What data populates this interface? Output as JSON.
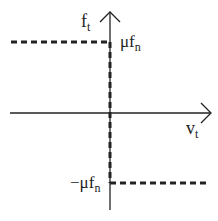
{
  "diagram": {
    "axes": {
      "y_label": "f",
      "y_label_sub": "t",
      "x_label": "v",
      "x_label_sub": "t"
    },
    "levels": {
      "upper_label": "μf",
      "upper_label_sub": "n",
      "lower_label": "−μf",
      "lower_label_sub": "n"
    },
    "colors": {
      "line": "#222222",
      "background": "#ffffff"
    }
  }
}
